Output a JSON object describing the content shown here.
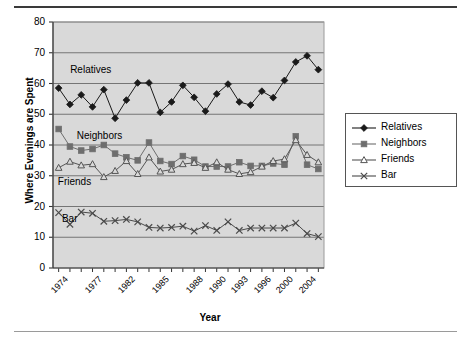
{
  "chart_data": {
    "type": "line",
    "title": "",
    "xlabel": "Year",
    "ylabel": "Where Evenings are Spent",
    "ylim": [
      0,
      80
    ],
    "ytick_step": 10,
    "yticks": [
      0,
      10,
      20,
      30,
      40,
      50,
      60,
      70,
      80
    ],
    "grid": true,
    "legend_position": "right",
    "plot_background": "#d9d9d9",
    "x": [
      1974,
      1975,
      1976,
      1977,
      1978,
      1980,
      1982,
      1983,
      1984,
      1985,
      1986,
      1987,
      1988,
      1989,
      1990,
      1991,
      1993,
      1994,
      1996,
      1998,
      2000,
      2002,
      2004,
      2006
    ],
    "xtick_labels": [
      "1974",
      "",
      "",
      "1977",
      "",
      "",
      "1982",
      "",
      "",
      "1985",
      "",
      "",
      "1988",
      "",
      "1990",
      "",
      "1993",
      "",
      "1996",
      "",
      "2000",
      "",
      "2004",
      ""
    ],
    "xticks_labeled": [
      "1974",
      "1977",
      "1982",
      "1985",
      "1988",
      "1990",
      "1993",
      "1996",
      "2000",
      "2004"
    ],
    "series": [
      {
        "name": "Relatives",
        "color": "#1a1a1a",
        "marker": "filled-diamond",
        "values": [
          58.5,
          53.2,
          56.3,
          52.4,
          58.0,
          48.7,
          54.6,
          60.2,
          60.2,
          50.6,
          54.0,
          59.4,
          55.5,
          51.0,
          56.6,
          59.8,
          54.0,
          53.0,
          57.5,
          55.4,
          61.0,
          67.0,
          69.0,
          64.5
        ]
      },
      {
        "name": "Neighbors",
        "color": "#6e6e6e",
        "marker": "filled-square",
        "values": [
          45.2,
          39.5,
          38.2,
          38.7,
          40.0,
          37.2,
          36.0,
          35.0,
          40.8,
          34.8,
          33.8,
          36.4,
          35.2,
          33.0,
          33.0,
          33.0,
          34.4,
          33.2,
          33.2,
          34.0,
          33.6,
          42.8,
          33.6,
          32.2
        ]
      },
      {
        "name": "Friends",
        "color": "#555555",
        "marker": "open-triangle",
        "values": [
          32.6,
          34.6,
          33.4,
          33.8,
          29.6,
          31.6,
          34.8,
          30.6,
          36.0,
          31.4,
          32.0,
          33.8,
          34.2,
          32.6,
          34.4,
          32.0,
          30.6,
          31.2,
          33.0,
          34.8,
          35.4,
          41.6,
          36.8,
          34.4
        ]
      },
      {
        "name": "Bar",
        "color": "#4a4a4a",
        "marker": "cross",
        "values": [
          18.0,
          14.2,
          18.2,
          17.8,
          15.2,
          15.4,
          15.8,
          15.0,
          13.2,
          13.0,
          13.2,
          13.6,
          12.0,
          13.8,
          12.2,
          15.0,
          12.2,
          13.0,
          13.0,
          13.0,
          13.0,
          14.6,
          11.2,
          10.2
        ]
      }
    ],
    "annotations": [
      {
        "text": "Relatives",
        "x": 1975.6,
        "y": 64.0
      },
      {
        "text": "Neighbors",
        "x": 1976.4,
        "y": 42.5
      },
      {
        "text": "Friends",
        "x": 1974.1,
        "y": 27.5
      },
      {
        "text": "Bar",
        "x": 1974.6,
        "y": 15.5
      }
    ],
    "legend": [
      {
        "label": "Relatives",
        "marker": "filled-diamond",
        "color": "#1a1a1a"
      },
      {
        "label": "Neighbors",
        "marker": "filled-square",
        "color": "#6e6e6e"
      },
      {
        "label": "Friends",
        "marker": "open-triangle",
        "color": "#555555"
      },
      {
        "label": "Bar",
        "marker": "cross",
        "color": "#4a4a4a"
      }
    ]
  }
}
